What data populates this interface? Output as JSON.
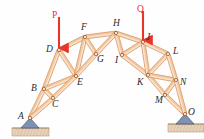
{
  "figure": {
    "kind": "truss-diagram",
    "title": "",
    "background_color": "#fefefe",
    "member_fill_color": "#f2c9a0",
    "member_edge_color": "#c9783c",
    "member_highlight_color": "#fbe6d2",
    "joint_marker_fill": "#fdf2e6",
    "joint_marker_edge": "#8a4a20",
    "label_color": "#2b2b2b",
    "load_color": "#e8342a",
    "support_fill_color": "#7f93b0",
    "support_edge_color": "#3f5472",
    "ground_fill_color": "#e7d3bb",
    "ground_edge_color": "#b79a78"
  },
  "joints": [
    {
      "name": "A",
      "x": 30,
      "y": 118,
      "label": "A",
      "label_x": 18,
      "label_y": 112
    },
    {
      "name": "B",
      "x": 44,
      "y": 89,
      "label": "B",
      "label_x": 31,
      "label_y": 84
    },
    {
      "name": "C",
      "x": 53,
      "y": 98,
      "label": "C",
      "label_x": 52,
      "label_y": 100
    },
    {
      "name": "D",
      "x": 59,
      "y": 50,
      "label": "D",
      "label_x": 46,
      "label_y": 45
    },
    {
      "name": "E",
      "x": 76,
      "y": 76,
      "label": "E",
      "label_x": 77,
      "label_y": 78
    },
    {
      "name": "F",
      "x": 85,
      "y": 37,
      "label": "F",
      "label_x": 81,
      "label_y": 23
    },
    {
      "name": "G",
      "x": 96,
      "y": 54,
      "label": "G",
      "label_x": 97,
      "label_y": 55
    },
    {
      "name": "H",
      "x": 116,
      "y": 33,
      "label": "H",
      "label_x": 113,
      "label_y": 19
    },
    {
      "name": "I",
      "x": 122,
      "y": 55,
      "label": "I",
      "label_x": 115,
      "label_y": 56
    },
    {
      "name": "J",
      "x": 143,
      "y": 42,
      "label": "J",
      "label_x": 146,
      "label_y": 33
    },
    {
      "name": "K",
      "x": 148,
      "y": 75,
      "label": "K",
      "label_x": 137,
      "label_y": 78
    },
    {
      "name": "L",
      "x": 168,
      "y": 54,
      "label": "L",
      "label_x": 173,
      "label_y": 47
    },
    {
      "name": "M",
      "x": 165,
      "y": 95,
      "label": "M",
      "label_x": 155,
      "label_y": 96
    },
    {
      "name": "N",
      "x": 176,
      "y": 80,
      "label": "N",
      "label_x": 180,
      "label_y": 78
    },
    {
      "name": "O",
      "x": 185,
      "y": 114,
      "label": "O",
      "label_x": 188,
      "label_y": 108
    }
  ],
  "members": [
    {
      "from": "A",
      "to": "B"
    },
    {
      "from": "A",
      "to": "C"
    },
    {
      "from": "B",
      "to": "C"
    },
    {
      "from": "B",
      "to": "D"
    },
    {
      "from": "B",
      "to": "E"
    },
    {
      "from": "C",
      "to": "E"
    },
    {
      "from": "D",
      "to": "E"
    },
    {
      "from": "D",
      "to": "F"
    },
    {
      "from": "E",
      "to": "F"
    },
    {
      "from": "E",
      "to": "G"
    },
    {
      "from": "F",
      "to": "G"
    },
    {
      "from": "F",
      "to": "H"
    },
    {
      "from": "G",
      "to": "H"
    },
    {
      "from": "H",
      "to": "I"
    },
    {
      "from": "H",
      "to": "J"
    },
    {
      "from": "I",
      "to": "J"
    },
    {
      "from": "I",
      "to": "K"
    },
    {
      "from": "J",
      "to": "K"
    },
    {
      "from": "J",
      "to": "L"
    },
    {
      "from": "K",
      "to": "L"
    },
    {
      "from": "K",
      "to": "M"
    },
    {
      "from": "K",
      "to": "N"
    },
    {
      "from": "L",
      "to": "N"
    },
    {
      "from": "M",
      "to": "N"
    },
    {
      "from": "M",
      "to": "O"
    },
    {
      "from": "N",
      "to": "O"
    }
  ],
  "loads": [
    {
      "name": "P",
      "label": "P",
      "label_x": 52,
      "label_y": 11,
      "arrow_x": 59,
      "arrow_top_y": 17,
      "arrow_tip_y": 48,
      "direction": "down"
    },
    {
      "name": "Q",
      "label": "Q",
      "label_x": 137,
      "label_y": 5,
      "arrow_x": 143,
      "arrow_top_y": 11,
      "arrow_tip_y": 40,
      "direction": "down"
    }
  ],
  "supports": [
    {
      "name": "support-a",
      "at_joint": "A",
      "type": "pin",
      "x": 30,
      "y": 118,
      "tri_half_width": 9,
      "tri_height": 10,
      "ground_x": 12,
      "ground_y": 128,
      "ground_width": 37,
      "ground_height": 8
    },
    {
      "name": "support-o",
      "at_joint": "O",
      "type": "pin",
      "x": 185,
      "y": 114,
      "tri_half_width": 9,
      "tri_height": 10,
      "ground_x": 168,
      "ground_y": 124,
      "ground_width": 36,
      "ground_height": 8
    }
  ]
}
